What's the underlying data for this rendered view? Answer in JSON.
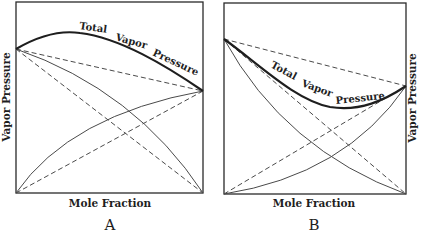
{
  "panels": [
    {
      "id": "A",
      "letter": "A",
      "xlabel": "Mole Fraction",
      "ylabel": "Vapor Pressure",
      "ylabel_side": "left",
      "curve_label_words": [
        "Total",
        "Vapor",
        "Pressure"
      ],
      "description": "Positive deviation from Raoult's law: total vapor pressure curve rises above the ideal straight line with a maximum"
    },
    {
      "id": "B",
      "letter": "B",
      "xlabel": "Mole Fraction",
      "ylabel": "Vapor Pressure",
      "ylabel_side": "right",
      "curve_label_words": [
        "Total",
        "Vapor",
        "Pressure"
      ],
      "description": "Negative deviation from Raoult's law: total vapor pressure curve sags below the ideal straight line with a minimum"
    }
  ],
  "colors": {
    "ink": "#1e1e1e",
    "line": "#4a4a4a",
    "background": "#ffffff"
  },
  "legend_semantics": {
    "heavy_solid": "Total vapor pressure (actual)",
    "light_solid": "Partial vapor pressures (actual)",
    "dashed": "Ideal (Raoult's law) pressures"
  }
}
